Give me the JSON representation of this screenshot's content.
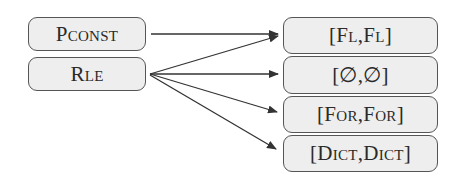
{
  "diagram": {
    "sources": [
      {
        "id": "pconst",
        "label": "Pconst"
      },
      {
        "id": "rle",
        "label": "Rle"
      }
    ],
    "targets": [
      {
        "id": "fl",
        "label": "[Fl,Fl]"
      },
      {
        "id": "empty",
        "label": "[∅,∅]"
      },
      {
        "id": "for",
        "label": "[For,For]"
      },
      {
        "id": "dict",
        "label": "[Dict,Dict]"
      }
    ],
    "edges": [
      {
        "from": "pconst",
        "to": "fl"
      },
      {
        "from": "rle",
        "to": "fl"
      },
      {
        "from": "rle",
        "to": "empty"
      },
      {
        "from": "rle",
        "to": "for"
      },
      {
        "from": "rle",
        "to": "dict"
      }
    ],
    "colors": {
      "box_fill": "#eeeeee",
      "box_border": "#555555",
      "arrow": "#333333",
      "text": "#2a2a2a"
    }
  }
}
